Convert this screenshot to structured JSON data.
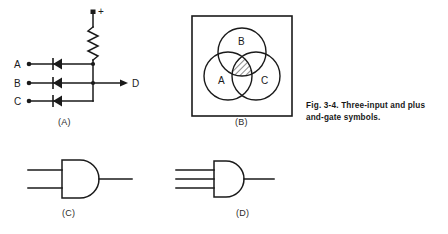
{
  "figure": {
    "caption_number": "Fig. 3-4.",
    "caption_text": "Three-input and plus and-gate symbols."
  },
  "panels": [
    {
      "id": "A",
      "sublabel": "(A)",
      "kind": "diode-and-gate-circuit",
      "supply_label": "+",
      "input_labels": [
        "A",
        "B",
        "C"
      ],
      "output_label": "D",
      "component_count": {
        "diodes": 3,
        "resistors": 1
      }
    },
    {
      "id": "B",
      "sublabel": "(B)",
      "kind": "venn-diagram",
      "circle_labels": [
        "A",
        "B",
        "C"
      ],
      "shaded_region": "A and B and C",
      "shading": "diagonal-hatch"
    },
    {
      "id": "C",
      "sublabel": "(C)",
      "kind": "and-gate-symbol",
      "inputs": 2
    },
    {
      "id": "D",
      "sublabel": "(D)",
      "kind": "and-gate-symbol",
      "inputs": 3
    }
  ],
  "venn": {
    "label_a": "A",
    "label_b": "B",
    "label_c": "C"
  },
  "circuit": {
    "supply": "+",
    "in_a": "A",
    "in_b": "B",
    "in_c": "C",
    "out_d": "D"
  },
  "colors": {
    "ink": "#1a1a1a",
    "paper": "#ffffff",
    "hatch": "#333333"
  }
}
